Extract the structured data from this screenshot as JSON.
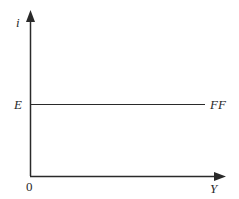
{
  "diagram": {
    "type": "economics-axis-diagram",
    "colors": {
      "axis": "#2a2a2a",
      "line": "#2a2a2a",
      "background": "#ffffff"
    },
    "y_axis": {
      "label": "i"
    },
    "x_axis": {
      "label": "Y"
    },
    "origin": {
      "label": "0"
    },
    "curves": [
      {
        "name": "FF",
        "label": "FF",
        "kind": "horizontal",
        "level_label": "E"
      }
    ]
  }
}
